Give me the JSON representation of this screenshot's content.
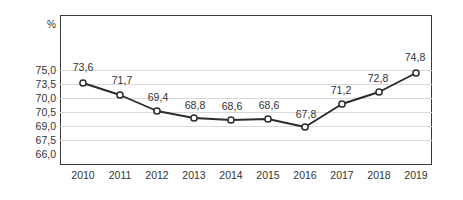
{
  "chart_data": {
    "type": "line",
    "title": "",
    "xlabel": "",
    "ylabel": "",
    "unit_label": "%",
    "grid": true,
    "legend": false,
    "categories": [
      "2010",
      "2011",
      "2012",
      "2013",
      "2014",
      "2015",
      "2016",
      "2017",
      "2018",
      "2019"
    ],
    "values": [
      73.6,
      71.7,
      69.4,
      68.8,
      68.6,
      68.6,
      67.8,
      71.2,
      72.8,
      74.8
    ],
    "point_labels": [
      "73,6",
      "71,7",
      "69,4",
      "68,8",
      "68,6",
      "68,6",
      "67,8",
      "71,2",
      "72,8",
      "74,8"
    ],
    "ytick_labels": [
      "75,0",
      "73,5",
      "70,0",
      "70,5",
      "69,0",
      "67,5",
      "66,0"
    ],
    "series": [
      {
        "name": "",
        "values": [
          73.6,
          71.7,
          69.4,
          68.8,
          68.6,
          68.6,
          67.8,
          71.2,
          72.8,
          74.8
        ],
        "marker": "open-circle",
        "color": "#2b2b2b"
      }
    ],
    "colors": {
      "line": "#2b2b2b",
      "marker_fill": "#ffffff",
      "grid": "#d9d9d9",
      "frame": "#3a3a3a",
      "text": "#333333",
      "background": "#ffffff"
    }
  },
  "layout": {
    "plot": {
      "left": 60,
      "top": 15,
      "width": 372,
      "height": 150
    },
    "ytick_y": [
      70,
      84,
      98,
      112,
      126,
      140,
      154
    ],
    "point_x": [
      83,
      120,
      157,
      194,
      231,
      268,
      305,
      342,
      379,
      416
    ],
    "point_y": [
      83,
      95,
      111,
      118,
      120,
      119,
      127,
      104,
      92,
      73
    ],
    "label_x": [
      83,
      122,
      158,
      195,
      232,
      269,
      306,
      341,
      378,
      415
    ],
    "label_y": [
      67,
      80,
      97,
      105,
      106,
      105,
      114,
      90,
      78,
      57
    ],
    "xtick_x": [
      83,
      120,
      157,
      194,
      231,
      268,
      305,
      342,
      379,
      416
    ]
  }
}
